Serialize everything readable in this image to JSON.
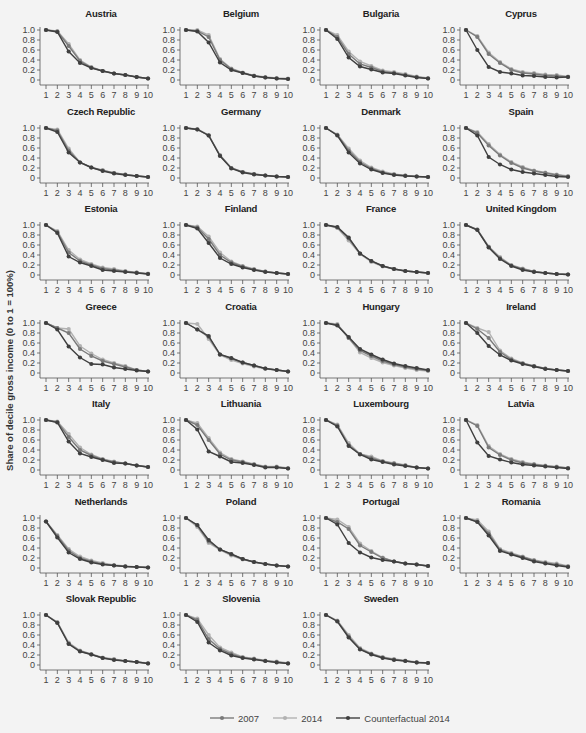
{
  "chart_data": {
    "type": "line",
    "layout": "small-multiples 4x7",
    "ylabel": "Share of decile gross income (0 to 1 = 100%)",
    "xlabel": "",
    "x": [
      1,
      2,
      3,
      4,
      5,
      6,
      7,
      8,
      9,
      10
    ],
    "yticks": [
      "0",
      "0.2",
      "0.4",
      "0.6",
      "0.8",
      "1.0"
    ],
    "ylim": [
      0,
      1.0
    ],
    "grid": false,
    "legend_position": "bottom",
    "series_meta": [
      {
        "key": "y2007",
        "name": "2007",
        "color": "#7a7a7a"
      },
      {
        "key": "y2014",
        "name": "2014",
        "color": "#b2b2b2"
      },
      {
        "key": "cf2014",
        "name": "Counterfactual 2014",
        "color": "#3f3f3f"
      }
    ],
    "panels": [
      {
        "title": "Austria",
        "y2007": [
          1.0,
          0.97,
          0.68,
          0.38,
          0.25,
          0.18,
          0.13,
          0.1,
          0.06,
          0.03
        ],
        "y2014": [
          1.0,
          0.98,
          0.72,
          0.4,
          0.26,
          0.18,
          0.13,
          0.1,
          0.06,
          0.03
        ],
        "cf2014": [
          1.0,
          0.96,
          0.57,
          0.34,
          0.24,
          0.18,
          0.13,
          0.1,
          0.06,
          0.03
        ]
      },
      {
        "title": "Belgium",
        "y2007": [
          1.0,
          0.98,
          0.86,
          0.4,
          0.22,
          0.14,
          0.08,
          0.05,
          0.03,
          0.02
        ],
        "y2014": [
          1.0,
          1.0,
          0.9,
          0.42,
          0.23,
          0.15,
          0.09,
          0.06,
          0.04,
          0.03
        ],
        "cf2014": [
          1.0,
          0.97,
          0.75,
          0.35,
          0.2,
          0.14,
          0.08,
          0.05,
          0.03,
          0.02
        ]
      },
      {
        "title": "Bulgaria",
        "y2007": [
          1.0,
          0.86,
          0.52,
          0.32,
          0.25,
          0.17,
          0.14,
          0.1,
          0.06,
          0.03
        ],
        "y2014": [
          1.0,
          0.9,
          0.57,
          0.37,
          0.28,
          0.19,
          0.16,
          0.12,
          0.07,
          0.04
        ],
        "cf2014": [
          1.0,
          0.82,
          0.45,
          0.27,
          0.21,
          0.15,
          0.13,
          0.09,
          0.05,
          0.03
        ]
      },
      {
        "title": "Cyprus",
        "y2007": [
          1.0,
          0.86,
          0.52,
          0.34,
          0.2,
          0.14,
          0.12,
          0.09,
          0.08,
          0.06
        ],
        "y2014": [
          1.0,
          0.88,
          0.55,
          0.36,
          0.22,
          0.16,
          0.14,
          0.11,
          0.1,
          0.07
        ],
        "cf2014": [
          1.0,
          0.6,
          0.26,
          0.16,
          0.13,
          0.09,
          0.08,
          0.06,
          0.05,
          0.06
        ]
      },
      {
        "title": "Czech Republic",
        "y2007": [
          1.0,
          0.95,
          0.55,
          0.31,
          0.21,
          0.15,
          0.1,
          0.07,
          0.04,
          0.02
        ],
        "y2014": [
          1.0,
          0.97,
          0.59,
          0.31,
          0.21,
          0.16,
          0.1,
          0.07,
          0.04,
          0.02
        ],
        "cf2014": [
          1.0,
          0.92,
          0.51,
          0.31,
          0.21,
          0.14,
          0.09,
          0.06,
          0.04,
          0.02
        ]
      },
      {
        "title": "Germany",
        "y2007": [
          1.0,
          0.97,
          0.85,
          0.45,
          0.2,
          0.12,
          0.08,
          0.05,
          0.03,
          0.02
        ],
        "y2014": [
          1.0,
          0.98,
          0.86,
          0.46,
          0.2,
          0.12,
          0.08,
          0.05,
          0.03,
          0.02
        ],
        "cf2014": [
          1.0,
          0.97,
          0.85,
          0.44,
          0.19,
          0.11,
          0.07,
          0.05,
          0.03,
          0.02
        ]
      },
      {
        "title": "Denmark",
        "y2007": [
          1.0,
          0.86,
          0.55,
          0.32,
          0.19,
          0.11,
          0.07,
          0.05,
          0.03,
          0.02
        ],
        "y2014": [
          1.0,
          0.87,
          0.59,
          0.35,
          0.21,
          0.13,
          0.08,
          0.05,
          0.03,
          0.02
        ],
        "cf2014": [
          1.0,
          0.85,
          0.51,
          0.29,
          0.17,
          0.1,
          0.06,
          0.04,
          0.03,
          0.02
        ]
      },
      {
        "title": "Spain",
        "y2007": [
          1.0,
          0.9,
          0.65,
          0.45,
          0.3,
          0.2,
          0.14,
          0.1,
          0.06,
          0.03
        ],
        "y2014": [
          1.0,
          0.92,
          0.68,
          0.47,
          0.32,
          0.22,
          0.15,
          0.11,
          0.07,
          0.04
        ],
        "cf2014": [
          1.0,
          0.85,
          0.42,
          0.27,
          0.17,
          0.12,
          0.09,
          0.06,
          0.03,
          0.02
        ]
      },
      {
        "title": "Estonia",
        "y2007": [
          1.0,
          0.86,
          0.45,
          0.28,
          0.2,
          0.13,
          0.1,
          0.07,
          0.05,
          0.02
        ],
        "y2014": [
          1.0,
          0.88,
          0.5,
          0.31,
          0.22,
          0.15,
          0.12,
          0.08,
          0.05,
          0.03
        ],
        "cf2014": [
          1.0,
          0.84,
          0.37,
          0.25,
          0.18,
          0.1,
          0.08,
          0.06,
          0.04,
          0.02
        ]
      },
      {
        "title": "Finland",
        "y2007": [
          1.0,
          0.95,
          0.72,
          0.4,
          0.25,
          0.17,
          0.11,
          0.07,
          0.04,
          0.02
        ],
        "y2014": [
          1.0,
          0.97,
          0.77,
          0.45,
          0.27,
          0.18,
          0.12,
          0.07,
          0.04,
          0.02
        ],
        "cf2014": [
          1.0,
          0.93,
          0.64,
          0.34,
          0.22,
          0.15,
          0.1,
          0.06,
          0.04,
          0.02
        ]
      },
      {
        "title": "France",
        "y2007": [
          1.0,
          0.95,
          0.73,
          0.43,
          0.28,
          0.18,
          0.12,
          0.08,
          0.06,
          0.04
        ],
        "y2014": [
          1.0,
          0.94,
          0.69,
          0.42,
          0.26,
          0.17,
          0.12,
          0.08,
          0.06,
          0.04
        ],
        "cf2014": [
          1.0,
          0.96,
          0.75,
          0.43,
          0.28,
          0.18,
          0.12,
          0.08,
          0.06,
          0.04
        ]
      },
      {
        "title": "United Kingdom",
        "y2007": [
          1.0,
          0.91,
          0.56,
          0.34,
          0.19,
          0.12,
          0.07,
          0.04,
          0.02,
          0.01
        ],
        "y2014": [
          1.0,
          0.91,
          0.57,
          0.36,
          0.2,
          0.13,
          0.07,
          0.04,
          0.02,
          0.01
        ],
        "cf2014": [
          1.0,
          0.9,
          0.55,
          0.32,
          0.18,
          0.1,
          0.06,
          0.04,
          0.02,
          0.01
        ]
      },
      {
        "title": "Greece",
        "y2007": [
          1.0,
          0.9,
          0.8,
          0.48,
          0.34,
          0.24,
          0.18,
          0.12,
          0.06,
          0.03
        ],
        "y2014": [
          1.0,
          0.9,
          0.88,
          0.54,
          0.39,
          0.27,
          0.2,
          0.14,
          0.06,
          0.03
        ],
        "cf2014": [
          1.0,
          0.87,
          0.53,
          0.31,
          0.18,
          0.17,
          0.11,
          0.08,
          0.05,
          0.03
        ]
      },
      {
        "title": "Croatia",
        "y2007": [
          1.0,
          0.87,
          0.72,
          0.37,
          0.29,
          0.21,
          0.15,
          0.09,
          0.06,
          0.03
        ],
        "y2014": [
          1.0,
          0.98,
          0.68,
          0.36,
          0.26,
          0.19,
          0.13,
          0.08,
          0.06,
          0.03
        ],
        "cf2014": [
          1.0,
          0.87,
          0.74,
          0.37,
          0.3,
          0.21,
          0.15,
          0.09,
          0.06,
          0.03
        ]
      },
      {
        "title": "Hungary",
        "y2007": [
          1.0,
          0.96,
          0.7,
          0.45,
          0.34,
          0.24,
          0.17,
          0.12,
          0.08,
          0.05
        ],
        "y2014": [
          1.0,
          0.98,
          0.7,
          0.41,
          0.3,
          0.21,
          0.15,
          0.1,
          0.06,
          0.04
        ],
        "cf2014": [
          1.0,
          0.95,
          0.72,
          0.48,
          0.37,
          0.27,
          0.19,
          0.14,
          0.1,
          0.06
        ]
      },
      {
        "title": "Ireland",
        "y2007": [
          1.0,
          0.88,
          0.7,
          0.42,
          0.27,
          0.19,
          0.14,
          0.09,
          0.06,
          0.04
        ],
        "y2014": [
          1.0,
          0.9,
          0.82,
          0.45,
          0.29,
          0.2,
          0.14,
          0.09,
          0.06,
          0.04
        ],
        "cf2014": [
          1.0,
          0.8,
          0.54,
          0.36,
          0.25,
          0.18,
          0.13,
          0.08,
          0.06,
          0.04
        ]
      },
      {
        "title": "Italy",
        "y2007": [
          1.0,
          0.96,
          0.66,
          0.4,
          0.29,
          0.21,
          0.16,
          0.13,
          0.09,
          0.06
        ],
        "y2014": [
          1.0,
          0.97,
          0.72,
          0.45,
          0.31,
          0.22,
          0.17,
          0.13,
          0.09,
          0.06
        ],
        "cf2014": [
          1.0,
          0.95,
          0.57,
          0.33,
          0.26,
          0.2,
          0.14,
          0.13,
          0.09,
          0.06
        ]
      },
      {
        "title": "Lithuania",
        "y2007": [
          1.0,
          0.9,
          0.6,
          0.32,
          0.2,
          0.16,
          0.11,
          0.06,
          0.06,
          0.03
        ],
        "y2014": [
          1.0,
          0.94,
          0.64,
          0.35,
          0.22,
          0.17,
          0.12,
          0.07,
          0.07,
          0.04
        ],
        "cf2014": [
          1.0,
          0.81,
          0.37,
          0.27,
          0.16,
          0.14,
          0.1,
          0.05,
          0.05,
          0.03
        ]
      },
      {
        "title": "Luxembourg",
        "y2007": [
          1.0,
          0.89,
          0.5,
          0.32,
          0.24,
          0.17,
          0.13,
          0.09,
          0.05,
          0.03
        ],
        "y2014": [
          1.0,
          0.91,
          0.54,
          0.32,
          0.27,
          0.18,
          0.14,
          0.1,
          0.05,
          0.03
        ],
        "cf2014": [
          1.0,
          0.87,
          0.48,
          0.31,
          0.21,
          0.16,
          0.11,
          0.08,
          0.05,
          0.03
        ]
      },
      {
        "title": "Latvia",
        "y2007": [
          1.0,
          0.88,
          0.45,
          0.3,
          0.2,
          0.14,
          0.11,
          0.08,
          0.06,
          0.04
        ],
        "y2014": [
          1.0,
          0.9,
          0.48,
          0.32,
          0.22,
          0.16,
          0.12,
          0.09,
          0.07,
          0.04
        ],
        "cf2014": [
          1.0,
          0.55,
          0.28,
          0.21,
          0.15,
          0.11,
          0.09,
          0.07,
          0.05,
          0.03
        ]
      },
      {
        "title": "Netherlands",
        "y2007": [
          0.93,
          0.64,
          0.35,
          0.2,
          0.13,
          0.08,
          0.05,
          0.03,
          0.02,
          0.01
        ],
        "y2014": [
          0.93,
          0.66,
          0.38,
          0.23,
          0.15,
          0.1,
          0.06,
          0.04,
          0.02,
          0.01
        ],
        "cf2014": [
          0.93,
          0.61,
          0.31,
          0.18,
          0.11,
          0.07,
          0.05,
          0.03,
          0.02,
          0.01
        ]
      },
      {
        "title": "Poland",
        "y2007": [
          1.0,
          0.85,
          0.53,
          0.37,
          0.27,
          0.18,
          0.12,
          0.08,
          0.05,
          0.03
        ],
        "y2014": [
          1.0,
          0.82,
          0.5,
          0.36,
          0.25,
          0.17,
          0.12,
          0.08,
          0.05,
          0.03
        ],
        "cf2014": [
          1.0,
          0.86,
          0.56,
          0.37,
          0.28,
          0.18,
          0.12,
          0.08,
          0.05,
          0.03
        ]
      },
      {
        "title": "Portugal",
        "y2007": [
          1.0,
          0.92,
          0.78,
          0.45,
          0.32,
          0.2,
          0.13,
          0.09,
          0.07,
          0.04
        ],
        "y2014": [
          1.0,
          0.97,
          0.82,
          0.49,
          0.34,
          0.21,
          0.13,
          0.09,
          0.07,
          0.04
        ],
        "cf2014": [
          1.0,
          0.87,
          0.5,
          0.31,
          0.21,
          0.16,
          0.13,
          0.09,
          0.07,
          0.04
        ]
      },
      {
        "title": "Romania",
        "y2007": [
          1.0,
          0.93,
          0.69,
          0.36,
          0.28,
          0.22,
          0.15,
          0.1,
          0.07,
          0.03
        ],
        "y2014": [
          1.0,
          0.96,
          0.73,
          0.38,
          0.3,
          0.23,
          0.16,
          0.12,
          0.09,
          0.04
        ],
        "cf2014": [
          1.0,
          0.92,
          0.65,
          0.34,
          0.27,
          0.2,
          0.13,
          0.09,
          0.05,
          0.02
        ]
      },
      {
        "title": "Slovak Republic",
        "y2007": [
          1.0,
          0.85,
          0.43,
          0.28,
          0.21,
          0.14,
          0.11,
          0.08,
          0.06,
          0.03
        ],
        "y2014": [
          1.0,
          0.86,
          0.45,
          0.29,
          0.22,
          0.15,
          0.12,
          0.08,
          0.06,
          0.04
        ],
        "cf2014": [
          1.0,
          0.84,
          0.42,
          0.27,
          0.21,
          0.14,
          0.1,
          0.08,
          0.06,
          0.03
        ]
      },
      {
        "title": "Slovenia",
        "y2007": [
          1.0,
          0.9,
          0.52,
          0.32,
          0.22,
          0.15,
          0.12,
          0.08,
          0.06,
          0.03
        ],
        "y2014": [
          1.0,
          0.93,
          0.6,
          0.35,
          0.25,
          0.16,
          0.13,
          0.09,
          0.07,
          0.04
        ],
        "cf2014": [
          1.0,
          0.86,
          0.45,
          0.29,
          0.19,
          0.14,
          0.11,
          0.08,
          0.05,
          0.03
        ]
      },
      {
        "title": "Sweden",
        "y2007": [
          1.0,
          0.88,
          0.57,
          0.32,
          0.22,
          0.15,
          0.11,
          0.08,
          0.05,
          0.04
        ],
        "y2014": [
          1.0,
          0.89,
          0.6,
          0.34,
          0.23,
          0.16,
          0.12,
          0.09,
          0.06,
          0.04
        ],
        "cf2014": [
          1.0,
          0.87,
          0.55,
          0.31,
          0.21,
          0.14,
          0.1,
          0.08,
          0.05,
          0.04
        ]
      }
    ]
  },
  "legend": {
    "items": [
      {
        "label": "2007",
        "color": "#7a7a7a"
      },
      {
        "label": "2014",
        "color": "#b2b2b2"
      },
      {
        "label": "Counterfactual 2014",
        "color": "#3f3f3f"
      }
    ]
  }
}
